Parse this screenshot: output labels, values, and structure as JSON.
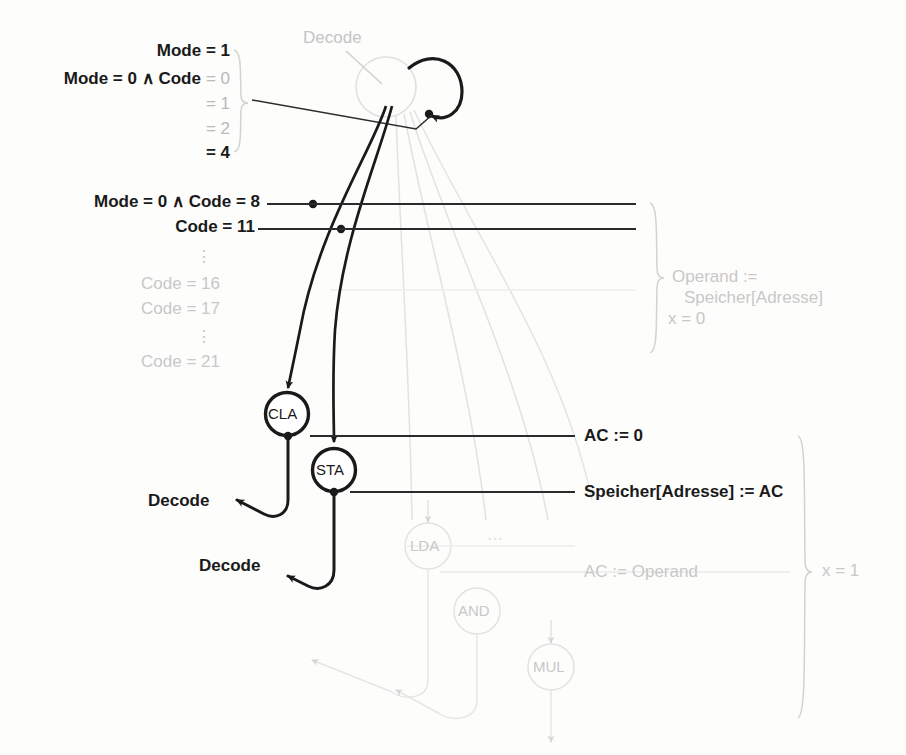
{
  "diagram": {
    "title_node": "Decode",
    "type": "state-transition-diagram",
    "language": "de"
  },
  "top_conditions": {
    "items": [
      {
        "text": "Mode = 1",
        "emphasis": "bold"
      },
      {
        "text": "Mode = 0 ∧ Code = 0",
        "emphasis": "mixed"
      },
      {
        "text": "= 1",
        "emphasis": "faint"
      },
      {
        "text": "= 2",
        "emphasis": "faint"
      },
      {
        "text": "= 4",
        "emphasis": "bold"
      }
    ],
    "mode1": "Mode = 1",
    "mode0_code0_prefix": "Mode = 0 ∧ Code",
    "eq0": "= 0",
    "eq1": "= 1",
    "eq2": "= 2",
    "eq4": "= 4"
  },
  "mid_conditions": {
    "code8": "Mode = 0 ∧ Code = 8",
    "code11": "Code = 11",
    "ellipsis1": "⋮",
    "code16": "Code = 16",
    "code17": "Code = 17",
    "ellipsis2": "⋮",
    "code21": "Code = 21"
  },
  "nodes": {
    "decode": "Decode",
    "cla": "CLA",
    "sta": "STA",
    "lda": "LDA",
    "and": "AND",
    "mul": "MUL",
    "dots": "⋯"
  },
  "returns": {
    "decode_from_cla": "Decode",
    "decode_from_sta": "Decode"
  },
  "actions": {
    "operand_line1": "Operand :=",
    "operand_line2": "Speicher[Adresse]",
    "x0": "x = 0",
    "ac0": "AC := 0",
    "store_ac": "Speicher[Adresse] := AC",
    "ac_operand": "AC := Operand",
    "x1": "x = 1"
  },
  "colors": {
    "ink": "#1a1a1a",
    "faint": "#c9c9c9",
    "mid": "#9f9f9f",
    "background": "#fdfdfc"
  }
}
